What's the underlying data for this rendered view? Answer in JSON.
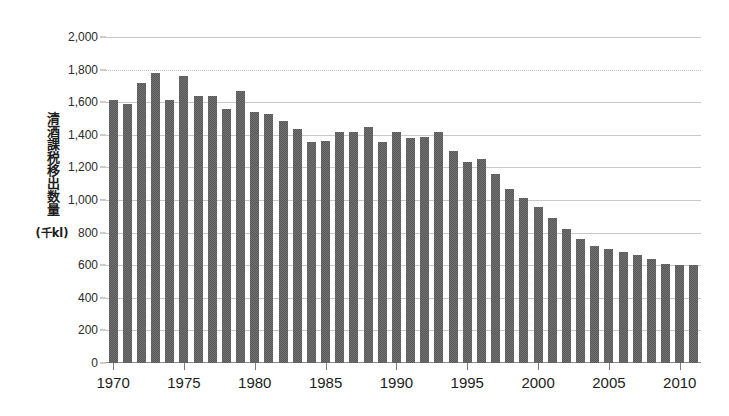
{
  "chart_data": {
    "type": "bar",
    "title": "",
    "subtitle": "",
    "xlabel": "",
    "ylabel": "清酒課税移出数量",
    "ylabel_unit": "(千kl)",
    "ylim": [
      0,
      2000
    ],
    "ystep": 200,
    "grid": true,
    "legend": null,
    "y_tick_labels": [
      "0",
      "200",
      "400",
      "600",
      "800",
      "1,000",
      "1,200",
      "1,400",
      "1,600",
      "1,800",
      "2,000"
    ],
    "y_tick_values": [
      0,
      200,
      400,
      600,
      800,
      1000,
      1200,
      1400,
      1600,
      1800,
      2000
    ],
    "x_tick_labels": [
      "1970",
      "1975",
      "1980",
      "1985",
      "1990",
      "1995",
      "2000",
      "2005",
      "2010"
    ],
    "x_tick_values": [
      1970,
      1975,
      1980,
      1985,
      1990,
      1995,
      2000,
      2005,
      2010
    ],
    "xlim": [
      1969.5,
      2011.5
    ],
    "bar_color": "#59595a",
    "categories": [
      1970,
      1971,
      1972,
      1973,
      1974,
      1975,
      1976,
      1977,
      1978,
      1979,
      1980,
      1981,
      1982,
      1983,
      1984,
      1985,
      1986,
      1987,
      1988,
      1989,
      1990,
      1991,
      1992,
      1993,
      1994,
      1995,
      1996,
      1997,
      1998,
      1999,
      2000,
      2001,
      2002,
      2003,
      2004,
      2005,
      2006,
      2007,
      2008,
      2009,
      2010,
      2011
    ],
    "values": [
      1613,
      1592,
      1715,
      1782,
      1611,
      1758,
      1636,
      1638,
      1560,
      1668,
      1540,
      1525,
      1483,
      1435,
      1355,
      1362,
      1418,
      1418,
      1445,
      1357,
      1415,
      1383,
      1385,
      1415,
      1300,
      1236,
      1250,
      1158,
      1068,
      1010,
      955,
      890,
      825,
      762,
      720,
      700,
      680,
      660,
      640,
      610,
      602,
      600
    ]
  }
}
